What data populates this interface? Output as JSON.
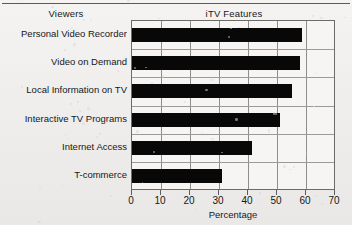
{
  "header": {
    "left_column_title": "Viewers",
    "right_column_title": "iTV Features"
  },
  "chart_data": {
    "type": "bar",
    "orientation": "horizontal",
    "title": "iTV Features",
    "xlabel": "Percentage",
    "ylabel": "Viewers",
    "categories": [
      "Personal Video Recorder",
      "Video on Demand",
      "Local Information on TV",
      "Interactive TV Programs",
      "Internet Access",
      "T-commerce"
    ],
    "values": [
      58.5,
      58,
      55,
      51,
      41.5,
      31
    ],
    "xlim": [
      0,
      70
    ],
    "xticks": [
      0,
      10,
      20,
      30,
      40,
      50,
      60,
      70
    ],
    "xtick_labels": [
      "0",
      "10",
      "20",
      "30",
      "40",
      "50",
      "60",
      "70"
    ],
    "grid": true,
    "legend": null,
    "bar_color": "#080808",
    "grid_color": "#8d8d8b",
    "frame_color": "#6b6b69",
    "background_color": "#f6f5f3"
  }
}
